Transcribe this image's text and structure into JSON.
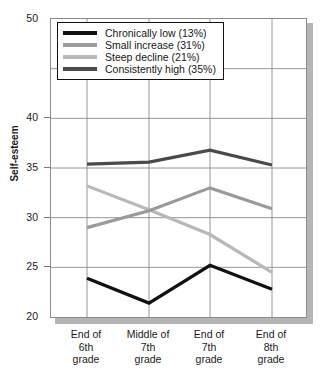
{
  "chart_data": {
    "type": "line",
    "title": "",
    "xlabel": "",
    "ylabel": "Self-esteem",
    "categories": [
      "End of 6th grade",
      "Middle of 7th grade",
      "End of 7th grade",
      "End of 8th grade"
    ],
    "category_lines": [
      [
        "End of",
        "6th",
        "grade"
      ],
      [
        "Middle of",
        "7th",
        "grade"
      ],
      [
        "End of",
        "7th",
        "grade"
      ],
      [
        "End of",
        "8th",
        "grade"
      ]
    ],
    "ylim": [
      20,
      50
    ],
    "yticks": [
      20,
      25,
      30,
      35,
      40,
      50
    ],
    "ytick_labels": [
      "20",
      "25",
      "30",
      "35",
      "40",
      "50"
    ],
    "grid": true,
    "legend_position": "top-left",
    "series": [
      {
        "name": "Chronically low (13%)",
        "label": "Chronically low",
        "percent": "13%",
        "color": "#111111",
        "values": [
          23.9,
          21.4,
          25.2,
          22.8
        ]
      },
      {
        "name": "Small increase (31%)",
        "label": "Small increase",
        "percent": "31%",
        "color": "#9a9a9a",
        "values": [
          29.0,
          30.7,
          33.0,
          30.9
        ]
      },
      {
        "name": "Steep decline (21%)",
        "label": "Steep decline",
        "percent": "21%",
        "color": "#b8b8b8",
        "values": [
          33.2,
          30.8,
          28.3,
          24.5
        ]
      },
      {
        "name": "Consistently high (35%)",
        "label": "Consistently high",
        "percent": "35%",
        "color": "#4a4a4a",
        "values": [
          35.4,
          35.6,
          36.8,
          35.3
        ]
      }
    ]
  },
  "axis": {
    "y_title": "Self-esteem"
  },
  "legend": {
    "items": [
      "Chronically low (13%)",
      "Small increase (31%)",
      "Steep decline (21%)",
      "Consistently high (35%)"
    ]
  },
  "colors": {
    "grid": "#8a8a8a",
    "frame": "#8a8a8a",
    "shadow": "#b5b5b5",
    "text": "#1a1a1a"
  }
}
